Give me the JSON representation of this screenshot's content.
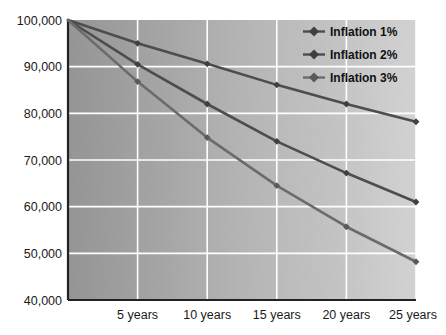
{
  "chart_data": {
    "type": "line",
    "title": "",
    "subtitle": "",
    "xlabel": "",
    "ylabel": "",
    "x": [
      0,
      5,
      10,
      15,
      20,
      25
    ],
    "categories": [
      "",
      "5 years",
      "10 years",
      "15 years",
      "20 years",
      "25 years"
    ],
    "xtick_labels": [
      "5 years",
      "10 years",
      "15 years",
      "20 years",
      "25 years"
    ],
    "xtick_values": [
      5,
      10,
      15,
      20,
      25
    ],
    "ytick_labels": [
      "100,000",
      "90,000",
      "80,000",
      "70,000",
      "60,000",
      "50,000",
      "40,000"
    ],
    "ytick_values": [
      100000,
      90000,
      80000,
      70000,
      60000,
      50000,
      40000
    ],
    "ylim": [
      40000,
      100000
    ],
    "xlim": [
      0,
      25
    ],
    "grid": true,
    "grid_color": "#ffffff",
    "legend_position": "top-right",
    "plot_background": "linear-gradient gray, dark left to light right",
    "plot_bg_left": "#9a9a9a",
    "plot_bg_right": "#cfcfcf",
    "series": [
      {
        "name": "Inflation 1%",
        "color": "#4d4d4d",
        "marker": "diamond",
        "values": [
          100000,
          95000,
          90600,
          86100,
          82000,
          78200
        ]
      },
      {
        "name": "Inflation 2%",
        "color": "#4d4d4d",
        "marker": "diamond",
        "values": [
          100000,
          90500,
          82000,
          74000,
          67200,
          61000
        ]
      },
      {
        "name": "Inflation 3%",
        "color": "#6b6b6b",
        "marker": "diamond",
        "values": [
          100000,
          86800,
          74800,
          64500,
          55700,
          48200
        ]
      }
    ]
  },
  "legend": {
    "items": [
      {
        "label": "Inflation 1%"
      },
      {
        "label": "Inflation 2%"
      },
      {
        "label": "Inflation 3%"
      }
    ]
  },
  "axis": {
    "y_labels": [
      "100,000",
      "90,000",
      "80,000",
      "70,000",
      "60,000",
      "50,000",
      "40,000"
    ],
    "x_labels": [
      "5 years",
      "10 years",
      "15 years",
      "20 years",
      "25 years"
    ]
  }
}
